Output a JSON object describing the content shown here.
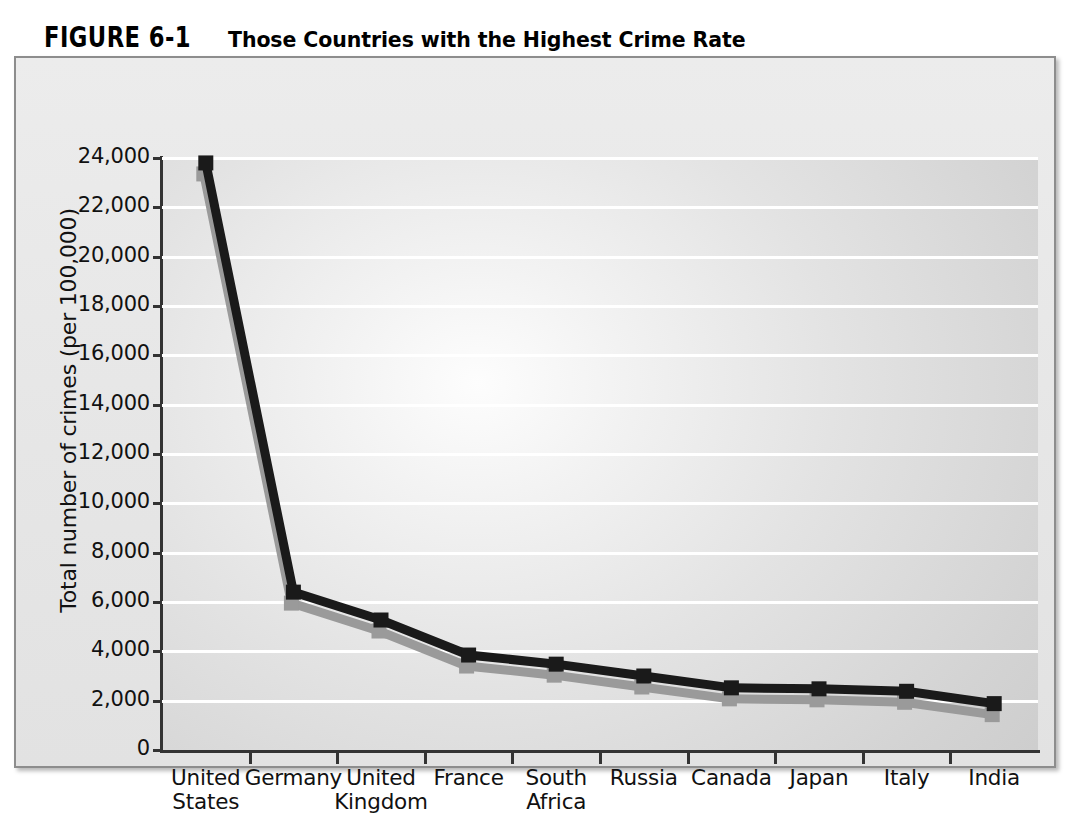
{
  "figure": {
    "number": "FIGURE 6-1",
    "title": "Those Countries with the Highest Crime Rate"
  },
  "chart_data": {
    "type": "line",
    "title": "Those Countries with the Highest Crime Rate",
    "xlabel": "",
    "ylabel": "Total number of crimes (per 100,000)",
    "categories": [
      "United\nStates",
      "Germany",
      "United\nKingdom",
      "France",
      "South\nAfrica",
      "Russia",
      "Canada",
      "Japan",
      "Italy",
      "India"
    ],
    "category_names": [
      "United States",
      "Germany",
      "United Kingdom",
      "France",
      "South Africa",
      "Russia",
      "Canada",
      "Japan",
      "Italy",
      "India"
    ],
    "values": [
      23800,
      6400,
      5270,
      3850,
      3480,
      3000,
      2520,
      2480,
      2380,
      1880
    ],
    "ylim": [
      0,
      24000
    ],
    "yticks": [
      0,
      2000,
      4000,
      6000,
      8000,
      10000,
      12000,
      14000,
      16000,
      18000,
      20000,
      22000,
      24000
    ],
    "ytick_labels": [
      "0",
      "2,000",
      "4,000",
      "6,000",
      "8,000",
      "10,000",
      "12,000",
      "14,000",
      "16,000",
      "18,000",
      "20,000",
      "22,000",
      "24,000"
    ],
    "grid": true,
    "gridline_color": "#ffffff",
    "legend": null,
    "series_color": "#1a1a1a",
    "shadow_color": "#9a9a9a",
    "marker": "square",
    "plot_background": "#dcdcdc",
    "panel_background": "#e9e9e9"
  }
}
